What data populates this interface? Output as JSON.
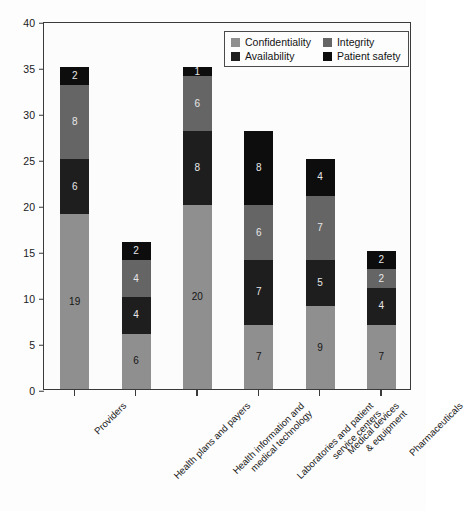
{
  "chart_data": {
    "type": "bar",
    "subtype": "stacked-bar",
    "title": "",
    "xlabel": "",
    "ylabel": "",
    "ylim": [
      0,
      40
    ],
    "ytick_step": 5,
    "yticks": [
      "0",
      "5",
      "10",
      "15",
      "20",
      "25",
      "30",
      "35",
      "40"
    ],
    "grid": false,
    "legend_position": "top-right",
    "categories": [
      "Providers",
      "Health plans and payers",
      "Health information and medical technology",
      "Laboratories and patient service centers",
      "Medical devices & equipment",
      "Pharmaceuticals"
    ],
    "category_lines": [
      [
        "Providers"
      ],
      [
        "Health plans and payers"
      ],
      [
        "Health information and",
        "medical technology"
      ],
      [
        "Laboratories and patient",
        "service centers"
      ],
      [
        "Medical devices",
        "& equipment"
      ],
      [
        "Pharmaceuticals"
      ]
    ],
    "series": [
      {
        "name": "Confidentiality",
        "color": "#8f8f8f",
        "label_color": "dark",
        "values": [
          19,
          6,
          20,
          7,
          9,
          7
        ]
      },
      {
        "name": "Availability",
        "color": "#1e1e1e",
        "label_color": "light",
        "values": [
          6,
          4,
          8,
          7,
          5,
          4
        ]
      },
      {
        "name": "Integrity",
        "color": "#656565",
        "label_color": "light",
        "values": [
          8,
          4,
          6,
          6,
          7,
          2
        ]
      },
      {
        "name": "Patient safety",
        "color": "#0d0d0d",
        "label_color": "light",
        "values": [
          2,
          2,
          1,
          8,
          4,
          2
        ]
      }
    ],
    "totals": [
      35,
      16,
      35,
      28,
      25,
      15
    ],
    "stack_order_bottom_to_top": [
      "Confidentiality",
      "Availability",
      "Integrity",
      "Patient safety"
    ]
  },
  "legend": {
    "items": [
      {
        "label": "Confidentiality",
        "color": "#8f8f8f"
      },
      {
        "label": "Integrity",
        "color": "#656565"
      },
      {
        "label": "Availability",
        "color": "#1e1e1e"
      },
      {
        "label": "Patient safety",
        "color": "#0d0d0d"
      }
    ]
  },
  "axis_color": "#3a3a3a",
  "background_color": "#fdfdfd"
}
